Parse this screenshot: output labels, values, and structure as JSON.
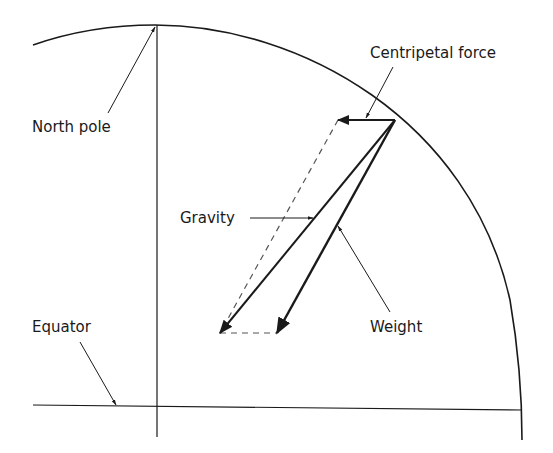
{
  "diagram": {
    "title": "",
    "labels": {
      "north_pole": "North pole",
      "equator": "Equator",
      "centripetal_force": "Centripetal force",
      "gravity": "Gravity",
      "weight": "Weight"
    },
    "colors": {
      "line": "#1a1a1a",
      "dashed": "#555555",
      "background": "#ffffff"
    }
  }
}
